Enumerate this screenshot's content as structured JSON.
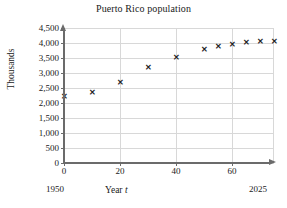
{
  "chart_data": {
    "type": "scatter",
    "title": "Puerto Rico population",
    "xlabel": "Year t",
    "xlabel_text": "Year",
    "xlabel_variable": "t",
    "ylabel": "Thousands",
    "xlim": [
      0,
      75
    ],
    "ylim": [
      0,
      4500
    ],
    "grid": true,
    "legend": null,
    "x_tick_labels": [
      "0",
      "20",
      "40",
      "60"
    ],
    "x_ticks": [
      0,
      20,
      40,
      60
    ],
    "y_tick_labels": [
      "0",
      "500",
      "1,000",
      "1,500",
      "2,000",
      "2,500",
      "3,000",
      "3,500",
      "4,000",
      "4,500"
    ],
    "y_ticks": [
      0,
      500,
      1000,
      1500,
      2000,
      2500,
      3000,
      3500,
      4000,
      4500
    ],
    "x_axis_start_label": "1950",
    "x_axis_end_label": "2025",
    "marker": "x",
    "marker_color": "#222222",
    "grid_color": "#d8d8d8",
    "axis_color": "#6b6b6b",
    "x": [
      0,
      10,
      20,
      30,
      40,
      50,
      55,
      60,
      65,
      70,
      75
    ],
    "values": [
      2210,
      2350,
      2690,
      3200,
      3520,
      3790,
      3880,
      3960,
      4030,
      4060,
      4040
    ],
    "points": [
      {
        "x": 0,
        "y": 2210
      },
      {
        "x": 10,
        "y": 2350
      },
      {
        "x": 20,
        "y": 2690
      },
      {
        "x": 30,
        "y": 3200
      },
      {
        "x": 40,
        "y": 3520
      },
      {
        "x": 50,
        "y": 3790
      },
      {
        "x": 55,
        "y": 3880
      },
      {
        "x": 60,
        "y": 3960
      },
      {
        "x": 65,
        "y": 4030
      },
      {
        "x": 70,
        "y": 4060
      },
      {
        "x": 75,
        "y": 4040
      }
    ]
  }
}
